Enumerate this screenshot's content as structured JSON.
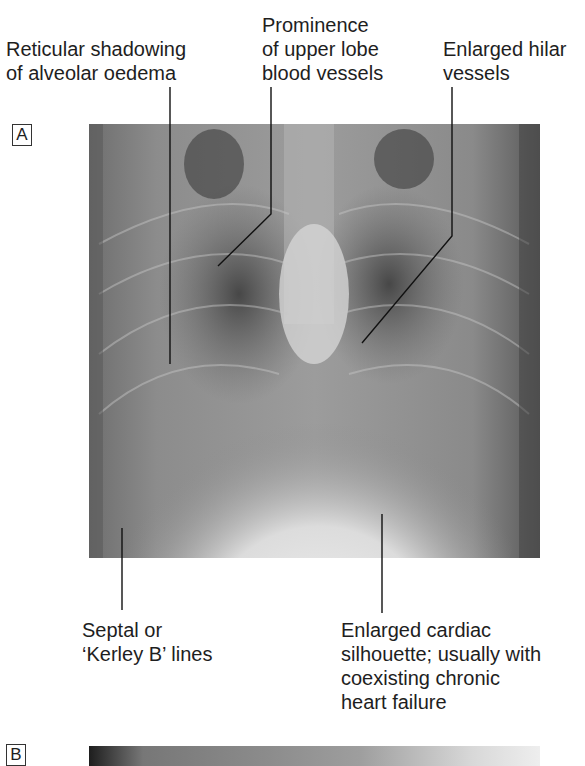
{
  "figure": {
    "panels": [
      {
        "tag": "A",
        "description": "Chest X-ray showing acute pulmonary oedema features"
      },
      {
        "tag": "B",
        "description": "Second chest X-ray (partially visible)"
      }
    ],
    "annotations": {
      "reticular_shadowing": "Reticular shadowing\nof alveolar oedema",
      "upper_lobe": "Prominence\nof upper lobe\nblood vessels",
      "hilar": "Enlarged hilar\nvessels",
      "septal_lines": "Septal or\n‘Kerley B’ lines",
      "cardiac_silhouette": "Enlarged cardiac\nsilhouette; usually with\ncoexisting chronic\nheart failure"
    },
    "colors": {
      "text": "#1e1e1e",
      "leader_line": "#111111",
      "xray_dark": "#3a3a3a",
      "xray_light": "#f2f2f2"
    }
  }
}
